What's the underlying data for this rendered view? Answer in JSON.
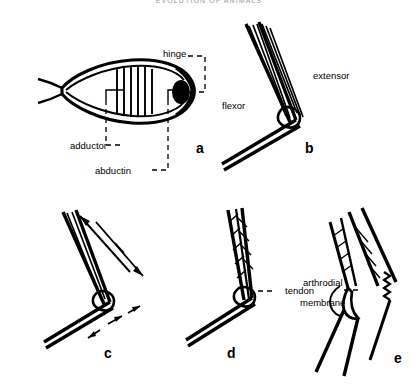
{
  "page": {
    "running_head": "EVOLUTION OF ANIMALS",
    "background_color": "#ffffff",
    "ink_color": "#000000"
  },
  "figure": {
    "caption_letters": [
      "a",
      "b",
      "c",
      "d",
      "e"
    ],
    "panels": [
      {
        "letter": "a",
        "subject": "bivalve-shell-cross-section",
        "labels": [
          "hinge",
          "adductor",
          "abductin"
        ]
      },
      {
        "letter": "b",
        "subject": "arthropod-joint-antagonistic-muscles",
        "labels": [
          "flexor",
          "extensor"
        ]
      },
      {
        "letter": "c",
        "subject": "arthropod-joint-movement-arrows",
        "labels": []
      },
      {
        "letter": "d",
        "subject": "arthropod-joint-pennate-muscle",
        "labels": [
          "tendon"
        ]
      },
      {
        "letter": "e",
        "subject": "arthropod-joint-flexed",
        "labels": [
          "arthrodial",
          "membrane"
        ]
      }
    ]
  },
  "labels": {
    "hinge": "hinge",
    "adductor": "adductor",
    "abductin": "abductin",
    "flexor": "flexor",
    "extensor": "extensor",
    "tendon": "tendon",
    "arthrodial": "arthrodial",
    "membrane": "membrane"
  },
  "panel_letters": {
    "a": "a",
    "b": "b",
    "c": "c",
    "d": "d",
    "e": "e"
  }
}
